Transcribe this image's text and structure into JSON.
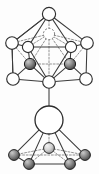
{
  "figure": {
    "background_color": "#fdfdfd",
    "width": 99,
    "height": 174,
    "caption": ""
  },
  "colors": {
    "edge_solid": "#3b3b3b",
    "edge_hidden": "#7e7e7e",
    "node_open_fill": "#ffffff",
    "node_open_stroke": "#2f2f2f",
    "node_shaded_dark_a": "#8e8e8e",
    "node_shaded_dark_b": "#4a4a4a",
    "node_shaded_light_a": "#d8d8d8",
    "node_shaded_light_b": "#909090"
  },
  "chart_data": {
    "type": "scatter",
    "xlabel": "",
    "ylabel": "",
    "grid": false,
    "legend": null,
    "xlim": [
      0,
      99
    ],
    "ylim": [
      0,
      174
    ],
    "nodes": [
      {
        "id": "n1",
        "label": "apex-top",
        "x": 49,
        "y": 14,
        "r": 6.6,
        "style": "open",
        "group": "upper-cage"
      },
      {
        "id": "n2",
        "label": "upper-inner-hidden",
        "x": 49,
        "y": 34,
        "r": 5.6,
        "style": "open-hidden",
        "group": "upper-cage"
      },
      {
        "id": "n3",
        "label": "upper-left-outer",
        "x": 12,
        "y": 43,
        "r": 6.3,
        "style": "open",
        "group": "upper-cage"
      },
      {
        "id": "n4",
        "label": "upper-left-inner",
        "x": 28,
        "y": 47,
        "r": 5.6,
        "style": "open",
        "group": "upper-cage"
      },
      {
        "id": "n5",
        "label": "upper-right-inner",
        "x": 71,
        "y": 47,
        "r": 5.6,
        "style": "open",
        "group": "upper-cage"
      },
      {
        "id": "n6",
        "label": "upper-right-outer",
        "x": 87,
        "y": 43,
        "r": 6.3,
        "style": "open",
        "group": "upper-cage"
      },
      {
        "id": "n7",
        "label": "shaded-left",
        "x": 30,
        "y": 64,
        "r": 5.6,
        "style": "shaded-dark",
        "group": "upper-cage"
      },
      {
        "id": "n8",
        "label": "shaded-right",
        "x": 70,
        "y": 64,
        "r": 5.6,
        "style": "shaded-dark",
        "group": "upper-cage"
      },
      {
        "id": "n9",
        "label": "lower-left-outer",
        "x": 13,
        "y": 79,
        "r": 6.3,
        "style": "open",
        "group": "upper-cage"
      },
      {
        "id": "n10",
        "label": "lower-right-outer",
        "x": 86,
        "y": 79,
        "r": 6.3,
        "style": "open",
        "group": "upper-cage"
      },
      {
        "id": "n11",
        "label": "cage-bottom-vertex",
        "x": 49,
        "y": 82,
        "r": 6.3,
        "style": "open",
        "group": "upper-cage"
      },
      {
        "id": "n12",
        "label": "central-large-atom",
        "x": 49,
        "y": 120,
        "r": 14.0,
        "style": "big",
        "group": "center"
      },
      {
        "id": "n13",
        "label": "base-center-sphere",
        "x": 49,
        "y": 148,
        "r": 5.4,
        "style": "shaded-light",
        "group": "lower-pyramid"
      },
      {
        "id": "n14",
        "label": "base-left-back",
        "x": 14,
        "y": 155,
        "r": 5.4,
        "style": "shaded-dark",
        "group": "lower-pyramid"
      },
      {
        "id": "n15",
        "label": "base-right-back",
        "x": 85,
        "y": 155,
        "r": 5.4,
        "style": "shaded-dark",
        "group": "lower-pyramid"
      },
      {
        "id": "n16",
        "label": "base-left-front",
        "x": 29,
        "y": 164,
        "r": 5.4,
        "style": "shaded-dark",
        "group": "lower-pyramid"
      },
      {
        "id": "n17",
        "label": "base-right-front",
        "x": 70,
        "y": 164,
        "r": 5.4,
        "style": "shaded-dark",
        "group": "lower-pyramid"
      }
    ],
    "edges_solid": [
      [
        "n1",
        "n3"
      ],
      [
        "n1",
        "n6"
      ],
      [
        "n1",
        "n4"
      ],
      [
        "n1",
        "n5"
      ],
      [
        "n3",
        "n4"
      ],
      [
        "n5",
        "n6"
      ],
      [
        "n4",
        "n5"
      ],
      [
        "n3",
        "n9"
      ],
      [
        "n6",
        "n10"
      ],
      [
        "n4",
        "n7"
      ],
      [
        "n5",
        "n8"
      ],
      [
        "n9",
        "n7"
      ],
      [
        "n10",
        "n8"
      ],
      [
        "n4",
        "n11"
      ],
      [
        "n5",
        "n11"
      ],
      [
        "n9",
        "n11"
      ],
      [
        "n10",
        "n11"
      ],
      [
        "n7",
        "n11"
      ],
      [
        "n8",
        "n11"
      ],
      [
        "n3",
        "n1"
      ],
      [
        "n9",
        "n3"
      ],
      [
        "n11",
        "n12"
      ],
      [
        "n12",
        "n14"
      ],
      [
        "n12",
        "n15"
      ],
      [
        "n12",
        "n16"
      ],
      [
        "n12",
        "n17"
      ],
      [
        "n14",
        "n16"
      ],
      [
        "n15",
        "n17"
      ],
      [
        "n16",
        "n17"
      ]
    ],
    "edges_hidden": [
      [
        "n1",
        "n2"
      ],
      [
        "n2",
        "n4"
      ],
      [
        "n2",
        "n5"
      ],
      [
        "n2",
        "n3"
      ],
      [
        "n2",
        "n6"
      ],
      [
        "n2",
        "n7"
      ],
      [
        "n2",
        "n8"
      ],
      [
        "n7",
        "n8"
      ],
      [
        "n7",
        "n3"
      ],
      [
        "n8",
        "n6"
      ],
      [
        "n2",
        "n11"
      ],
      [
        "n12",
        "n13"
      ],
      [
        "n13",
        "n14"
      ],
      [
        "n13",
        "n15"
      ],
      [
        "n13",
        "n16"
      ],
      [
        "n13",
        "n17"
      ],
      [
        "n14",
        "n15"
      ]
    ]
  }
}
